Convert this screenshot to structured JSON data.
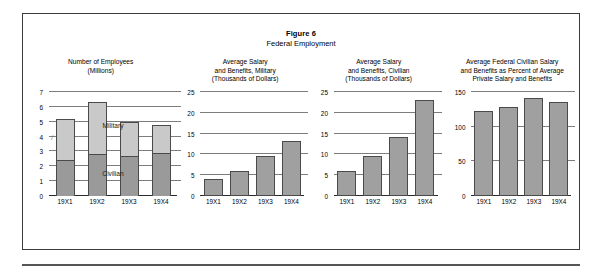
{
  "figure": {
    "number_label": "Figure 6",
    "subtitle": "Federal Employment"
  },
  "chart_data": [
    {
      "type": "bar",
      "stacked": true,
      "title": "Number of Employees\n(Millions)",
      "title_lines": [
        "Number of Employees",
        "(Millions)"
      ],
      "categories": [
        "19X1",
        "19X2",
        "19X3",
        "19X4"
      ],
      "series": [
        {
          "name": "Civilian",
          "values": [
            2.4,
            2.8,
            2.7,
            2.9
          ],
          "color": "#9a9a9a"
        },
        {
          "name": "Military",
          "values": [
            2.8,
            3.5,
            2.3,
            1.85
          ],
          "color": "#c9c9c9"
        }
      ],
      "totals": [
        5.2,
        6.3,
        5.0,
        4.75
      ],
      "xlabel": "",
      "ylabel": "",
      "ylim": [
        0,
        7
      ],
      "yticks": [
        0,
        1,
        2,
        3,
        4,
        5,
        6,
        7
      ],
      "ytick_labels": [
        "0",
        "1",
        "2",
        "3",
        "4",
        "5",
        "6",
        "7"
      ],
      "grid": true,
      "legend_position": "in-plot-annotations",
      "annotations": [
        "Military",
        "Civilian"
      ]
    },
    {
      "type": "bar",
      "stacked": false,
      "title": "Average Salary\nand Benefits, Military\n(Thousands of Dollars)",
      "title_lines": [
        "Average Salary",
        "and Benefits, Military",
        "(Thousands of Dollars)"
      ],
      "categories": [
        "19X1",
        "19X2",
        "19X3",
        "19X4"
      ],
      "values": [
        4.0,
        6.0,
        9.5,
        13.3
      ],
      "xlabel": "",
      "ylabel": "",
      "ylim": [
        0,
        25
      ],
      "yticks": [
        0,
        5,
        10,
        15,
        20,
        25
      ],
      "ytick_labels": [
        "0",
        "5",
        "10",
        "15",
        "20",
        "25"
      ],
      "grid": true,
      "bar_color": "#a0a0a0"
    },
    {
      "type": "bar",
      "stacked": false,
      "title": "Average Salary\nand Benefits, Civilian\n(Thousands of Dollars)",
      "title_lines": [
        "Average Salary",
        "and Benefits, Civilian",
        "(Thousands of Dollars)"
      ],
      "categories": [
        "19X1",
        "19X2",
        "19X3",
        "19X4"
      ],
      "values": [
        6.1,
        9.6,
        14.3,
        23.0
      ],
      "xlabel": "",
      "ylabel": "",
      "ylim": [
        0,
        25
      ],
      "yticks": [
        0,
        5,
        10,
        15,
        20,
        25
      ],
      "ytick_labels": [
        "0",
        "5",
        "10",
        "15",
        "20",
        "25"
      ],
      "grid": true,
      "bar_color": "#a0a0a0"
    },
    {
      "type": "bar",
      "stacked": false,
      "title": "Average Federal Civilian Salary\nand Benefits as Percent of Average\nPrivate Salary and Benefits",
      "title_lines": [
        "Average Federal Civilian Salary",
        "and Benefits as Percent of Average",
        "Private Salary and Benefits"
      ],
      "categories": [
        "19X1",
        "19X2",
        "19X3",
        "19X4"
      ],
      "values": [
        122,
        128,
        142,
        135
      ],
      "xlabel": "",
      "ylabel": "",
      "ylim": [
        0,
        150
      ],
      "yticks": [
        0,
        50,
        100,
        150
      ],
      "ytick_labels": [
        "0",
        "50",
        "100",
        "150"
      ],
      "grid": true,
      "bar_color": "#a0a0a0"
    }
  ],
  "marks": {
    "slash": "/"
  }
}
